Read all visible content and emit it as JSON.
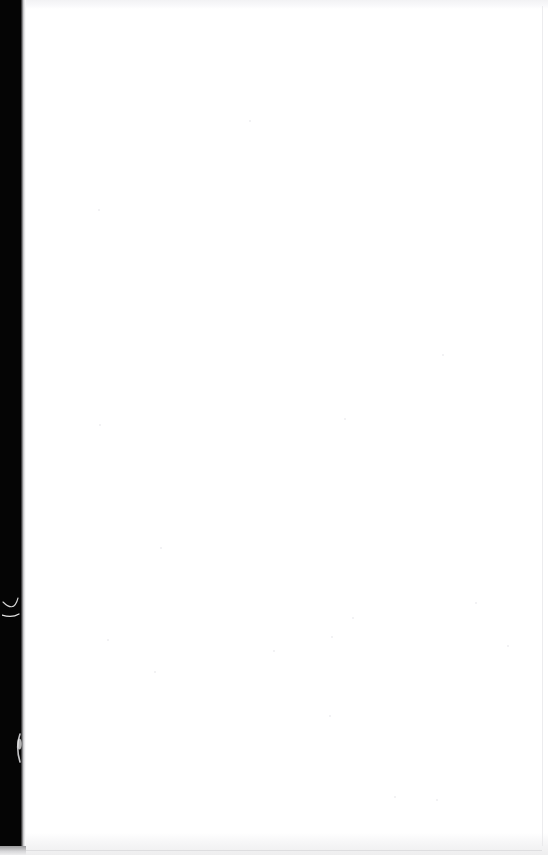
{
  "document": {
    "kind": "scanned-book-page",
    "page_state": "blank",
    "visible_text": "",
    "page_width_px": 548,
    "page_height_px": 855
  },
  "colors": {
    "paper": "#ffffff",
    "gutter": "#050505",
    "gutter_edge": "#6e6e70",
    "scan_band": "#f0f0f2",
    "hairline": "#dcdcde",
    "speckle": "#d9d9dd"
  },
  "regions": {
    "gutter": {
      "name": "binding-gutter",
      "x": 0,
      "y": 0,
      "width": 21,
      "height": 846
    },
    "paper_field": {
      "name": "blank-paper-field",
      "x": 26,
      "y": 9,
      "width": 516,
      "height": 824
    }
  },
  "artifacts": [
    {
      "name": "scratch-curve",
      "description": "thin white curved scratch in gutter",
      "x": 2,
      "y": 588,
      "width": 22,
      "height": 34
    },
    {
      "name": "scratch-nick",
      "description": "white sliver nick at gutter edge",
      "x": 12,
      "y": 730,
      "width": 14,
      "height": 36
    }
  ],
  "speckles": [
    {
      "x": 99,
      "y": 210,
      "r": 1.2
    },
    {
      "x": 250,
      "y": 121,
      "r": 1.0
    },
    {
      "x": 443,
      "y": 355,
      "r": 1.1
    },
    {
      "x": 161,
      "y": 548,
      "r": 1.3
    },
    {
      "x": 345,
      "y": 419,
      "r": 1.0
    },
    {
      "x": 353,
      "y": 618,
      "r": 1.4
    },
    {
      "x": 332,
      "y": 637,
      "r": 1.0
    },
    {
      "x": 330,
      "y": 716,
      "r": 1.1
    },
    {
      "x": 108,
      "y": 640,
      "r": 1.0
    },
    {
      "x": 476,
      "y": 603,
      "r": 1.2
    },
    {
      "x": 508,
      "y": 646,
      "r": 1.0
    },
    {
      "x": 155,
      "y": 672,
      "r": 0.9
    },
    {
      "x": 100,
      "y": 425,
      "r": 1.0
    },
    {
      "x": 274,
      "y": 651,
      "r": 1.0
    },
    {
      "x": 437,
      "y": 800,
      "r": 1.1
    },
    {
      "x": 395,
      "y": 797,
      "r": 0.9
    }
  ]
}
